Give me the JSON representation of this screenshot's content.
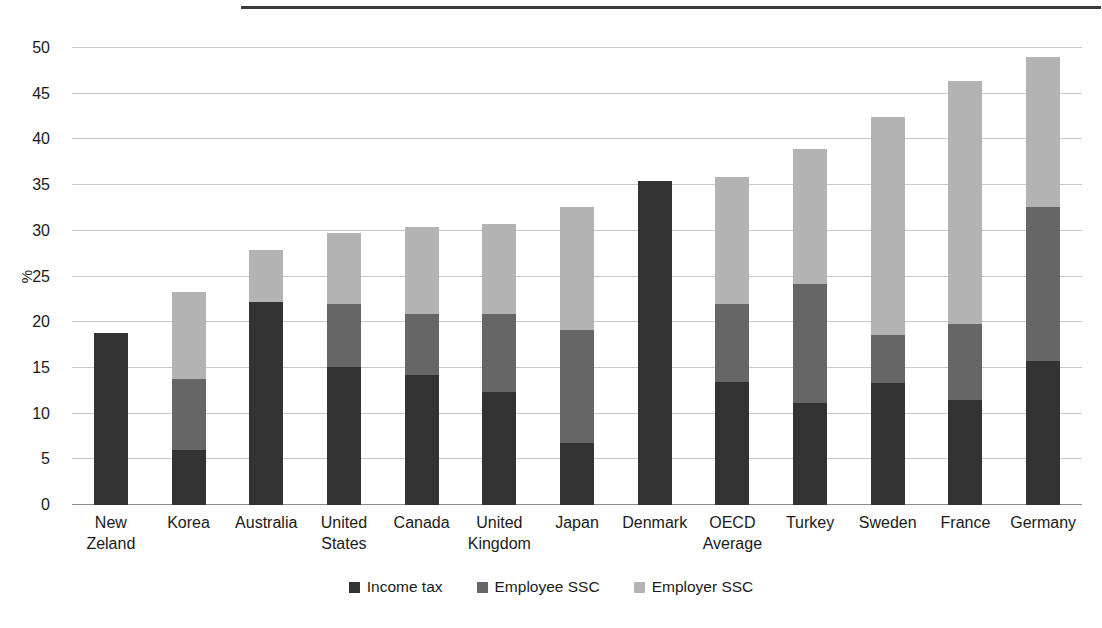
{
  "chart_data": {
    "type": "bar",
    "subtype": "stacked-bar",
    "title": "",
    "subtitle": "",
    "xlabel": "",
    "ylabel": "%",
    "ylim": [
      0,
      50
    ],
    "ytick_step": 5,
    "ytick_labels": [
      "0",
      "5",
      "10",
      "15",
      "20",
      "25",
      "30",
      "35",
      "40",
      "45",
      "50"
    ],
    "ytick_values": [
      0,
      5,
      10,
      15,
      20,
      25,
      30,
      35,
      40,
      45,
      50
    ],
    "grid": true,
    "grid_axis": "y",
    "legend_position": "bottom-center",
    "categories": [
      "New Zeland",
      "Korea",
      "Australia",
      "United States",
      "Canada",
      "United Kingdom",
      "Japan",
      "Denmark",
      "OECD Average",
      "Turkey",
      "Sweden",
      "France",
      "Germany"
    ],
    "category_lines": [
      [
        "New",
        "Zeland"
      ],
      [
        "Korea"
      ],
      [
        "Australia"
      ],
      [
        "United",
        "States"
      ],
      [
        "Canada"
      ],
      [
        "United",
        "Kingdom"
      ],
      [
        "Japan"
      ],
      [
        "Denmark"
      ],
      [
        "OECD",
        "Average"
      ],
      [
        "Turkey"
      ],
      [
        "Sweden"
      ],
      [
        "France"
      ],
      [
        "Germany"
      ]
    ],
    "series": [
      {
        "name": "Income tax",
        "color": "#333333",
        "values": [
          18.8,
          6.0,
          22.2,
          15.1,
          14.2,
          12.4,
          6.8,
          35.5,
          13.5,
          11.2,
          13.3,
          11.5,
          15.8
        ]
      },
      {
        "name": "Employee SSC",
        "color": "#666666",
        "values": [
          0.0,
          7.8,
          0.0,
          6.9,
          6.7,
          8.5,
          12.4,
          0.0,
          8.5,
          13.0,
          5.3,
          8.3,
          16.8
        ]
      },
      {
        "name": "Employer SSC",
        "color": "#b3b3b3",
        "values": [
          0.0,
          9.5,
          5.7,
          7.8,
          9.5,
          9.9,
          13.4,
          0.0,
          13.9,
          14.8,
          23.8,
          26.6,
          16.4
        ]
      }
    ],
    "totals": [
      18.8,
      23.3,
      27.9,
      29.8,
      30.4,
      30.8,
      32.6,
      35.5,
      35.9,
      39.0,
      42.4,
      46.4,
      49.0
    ]
  },
  "legend": {
    "entries": [
      {
        "label": "Income tax",
        "color": "#333333"
      },
      {
        "label": "Employee SSC",
        "color": "#666666"
      },
      {
        "label": "Employer SSC",
        "color": "#b3b3b3"
      }
    ]
  },
  "colors": {
    "income_tax": "#333333",
    "employee_ssc": "#666666",
    "employer_ssc": "#b3b3b3",
    "gridline": "#c9c9c9",
    "axis": "#8d8d8d",
    "background": "#ffffff",
    "text": "#1a1a1a"
  }
}
